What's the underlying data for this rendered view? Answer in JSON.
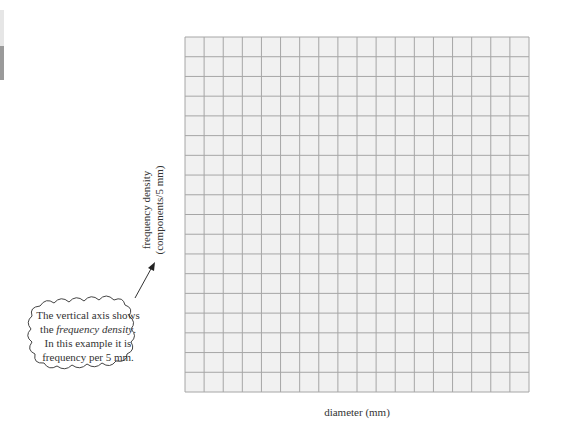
{
  "chart_data": {
    "type": "bar",
    "subtype": "histogram",
    "title": "",
    "xlabel": "diameter (mm)",
    "ylabel": "frequency density (components/5 mm)",
    "ylabel_line1": "frequency density",
    "ylabel_line2": "(components/5 mm)",
    "bins": [
      {
        "from": 25,
        "to": 30,
        "value": 1
      },
      {
        "from": 30,
        "to": 35,
        "value": 3
      },
      {
        "from": 35,
        "to": 40,
        "value": 7
      },
      {
        "from": 40,
        "to": 45,
        "value": 15
      },
      {
        "from": 45,
        "to": 50,
        "value": 17
      },
      {
        "from": 50,
        "to": 55,
        "value": 10
      },
      {
        "from": 55,
        "to": 60,
        "value": 5
      },
      {
        "from": 60,
        "to": 65,
        "value": 2
      }
    ],
    "categories": [
      "25-30",
      "30-35",
      "35-40",
      "40-45",
      "45-50",
      "50-55",
      "55-60",
      "60-65"
    ],
    "values": [
      1,
      3,
      7,
      15,
      17,
      10,
      5,
      2
    ],
    "x_ticks": [
      25,
      30,
      35,
      40,
      45,
      50,
      55,
      60,
      65
    ],
    "y_ticks": [
      0,
      2,
      4,
      6,
      8,
      10,
      12,
      14,
      16,
      18
    ],
    "ylim": [
      0,
      18
    ],
    "xlim": [
      20,
      65
    ],
    "x_axis_break": true,
    "grid": true,
    "legend": null,
    "annotation": {
      "type": "callout-cloud",
      "lines": [
        "The vertical axis shows",
        "the frequency density.",
        "In this example it is",
        "frequency per 5 mm."
      ],
      "italic_phrase": "frequency density"
    }
  },
  "colors": {
    "bar_fill": "#a9a9a9",
    "bar_stroke": "#4a4a4a",
    "grid_bg": "#f1f1f1",
    "grid_line": "#a6a6a6",
    "axis": "#222222"
  },
  "callout": {
    "line1": "The vertical axis shows",
    "line2_prefix": "the ",
    "line2_italic": "frequency density",
    "line2_suffix": ".",
    "line3": "In this example it is",
    "line4": "frequency per 5 mm."
  }
}
